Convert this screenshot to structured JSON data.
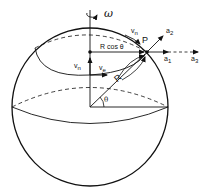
{
  "figure": {
    "type": "sphere-rotation-diagram",
    "labels": {
      "omega": "ω",
      "radius_projection": "R cos θ",
      "point": "P",
      "radius": "R",
      "theta": "θ",
      "v_north_top": {
        "base": "v",
        "sub": "n"
      },
      "v_north_axis": {
        "base": "v",
        "sub": "n"
      },
      "v_east": {
        "base": "v",
        "sub": "e"
      },
      "a1": {
        "base": "a",
        "sub": "1"
      },
      "a2": {
        "base": "a",
        "sub": "2"
      },
      "a3": {
        "base": "a",
        "sub": "3"
      }
    },
    "colors": {
      "stroke": "#111111",
      "background": "#ffffff"
    }
  }
}
